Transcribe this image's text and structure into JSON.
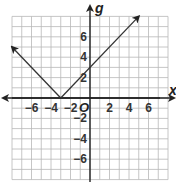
{
  "chart_data": {
    "type": "line",
    "title": "",
    "xlabel": "x",
    "ylabel": "g",
    "origin_label": "O",
    "xlim": [
      -8,
      8
    ],
    "ylim": [
      -8,
      8
    ],
    "grid": true,
    "grid_step": 1,
    "x_tick_labels": [
      {
        "value": -6,
        "label": "−6"
      },
      {
        "value": -4,
        "label": "−4"
      },
      {
        "value": -2,
        "label": "−2"
      },
      {
        "value": 2,
        "label": "2"
      },
      {
        "value": 4,
        "label": "4"
      },
      {
        "value": 6,
        "label": "6"
      }
    ],
    "y_tick_labels": [
      {
        "value": 6,
        "label": "6"
      },
      {
        "value": 4,
        "label": "4"
      },
      {
        "value": 2,
        "label": "2"
      },
      {
        "value": -2,
        "label": "−2"
      },
      {
        "value": -4,
        "label": "−4"
      },
      {
        "value": -6,
        "label": "−6"
      }
    ],
    "series": [
      {
        "name": "g(x) = |x + 3|",
        "points": [
          [
            -8,
            5
          ],
          [
            -3,
            0
          ],
          [
            5,
            8
          ]
        ],
        "arrows": [
          "start",
          "end"
        ],
        "color": "#333333"
      }
    ],
    "vertex": [
      -3,
      0
    ],
    "colors": {
      "grid": "#b8b8b8",
      "axis": "#222222",
      "line": "#333333"
    }
  }
}
